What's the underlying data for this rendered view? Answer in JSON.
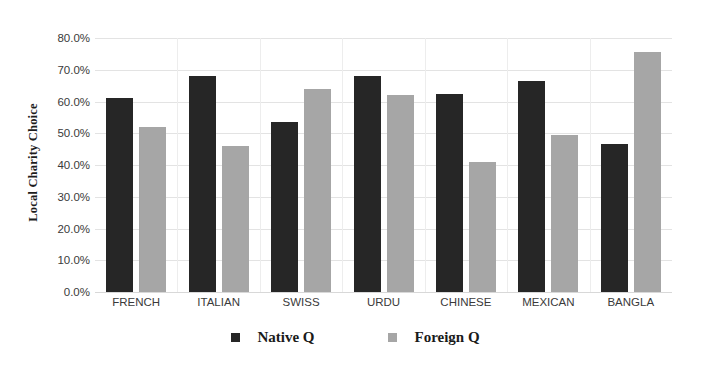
{
  "chart_data": {
    "type": "bar",
    "title": "",
    "xlabel": "",
    "ylabel": "Local Charity Choice",
    "categories": [
      "FRENCH",
      "ITALIAN",
      "SWISS",
      "URDU",
      "CHINESE",
      "MEXICAN",
      "BANGLA"
    ],
    "series": [
      {
        "name": "Native Q",
        "color": "#262626",
        "values": [
          61.0,
          68.0,
          53.5,
          68.0,
          62.5,
          66.5,
          46.5
        ]
      },
      {
        "name": "Foreign Q",
        "color": "#a6a6a6",
        "values": [
          52.0,
          46.0,
          64.0,
          62.0,
          41.0,
          49.5,
          75.5
        ]
      }
    ],
    "ylim": [
      0,
      80
    ],
    "ytick_values": [
      80,
      70,
      60,
      50,
      40,
      30,
      20,
      10,
      0
    ],
    "ytick_labels": [
      "80.0%",
      "70.0%",
      "60.0%",
      "50.0%",
      "40.0%",
      "30.0%",
      "20.0%",
      "10.0%",
      "0.0%"
    ],
    "grid": true,
    "legend_position": "bottom"
  },
  "legend": {
    "items": [
      {
        "label": "Native Q",
        "marker": "square-dark"
      },
      {
        "label": "Foreign Q",
        "marker": "square-gray"
      }
    ]
  }
}
